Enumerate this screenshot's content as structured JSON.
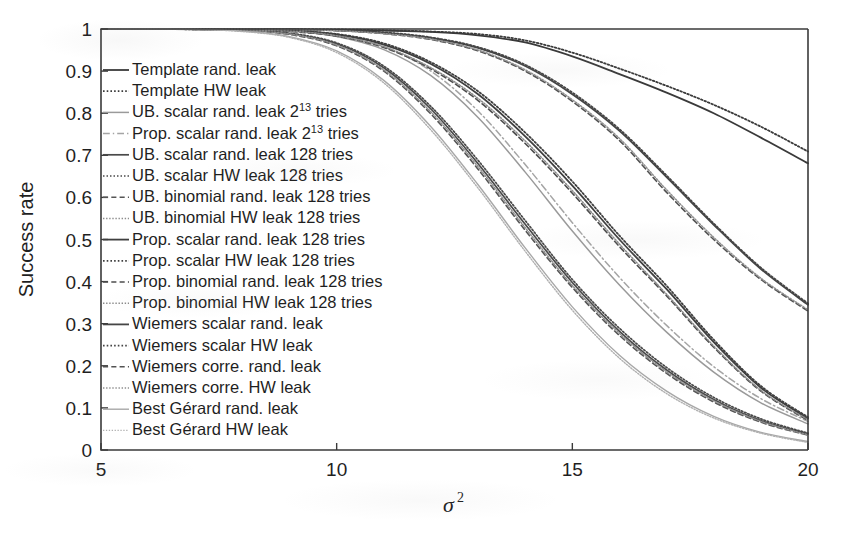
{
  "chart_data": {
    "type": "line",
    "title": "",
    "xlabel": "σ²",
    "ylabel": "Success rate",
    "xlim": [
      5,
      20
    ],
    "ylim": [
      0,
      1
    ],
    "xticks": [
      "5",
      "10",
      "15",
      "20"
    ],
    "yticks": [
      "0",
      "0.1",
      "0.2",
      "0.3",
      "0.4",
      "0.5",
      "0.6",
      "0.7",
      "0.8",
      "0.9",
      "1"
    ],
    "grid": false,
    "legend_position": "inside-left",
    "x": [
      5,
      6,
      7,
      8,
      9,
      10,
      11,
      12,
      13,
      14,
      15,
      16,
      17,
      18,
      19,
      20
    ],
    "series": [
      {
        "name": "Template rand. leak",
        "label": "Template rand. leak",
        "style": "solid",
        "color": "#3a3a3a",
        "width": 1.8,
        "values": [
          1.0,
          1.0,
          1.0,
          1.0,
          0.999,
          0.998,
          0.996,
          0.993,
          0.985,
          0.968,
          0.935,
          0.893,
          0.849,
          0.8,
          0.742,
          0.681
        ]
      },
      {
        "name": "Template HW leak",
        "label": "Template HW leak",
        "style": "dotted",
        "color": "#3a3a3a",
        "width": 1.8,
        "values": [
          1.0,
          1.0,
          1.0,
          1.0,
          0.999,
          0.999,
          0.997,
          0.994,
          0.988,
          0.973,
          0.944,
          0.906,
          0.865,
          0.82,
          0.768,
          0.709
        ]
      },
      {
        "name": "UB. scalar rand. leak 2^13 tries",
        "label": "UB. scalar rand. leak 2",
        "label_sup": "13",
        "label_tail": " tries",
        "style": "solid",
        "color": "#9a9a9a",
        "width": 1.5,
        "values": [
          1.0,
          1.0,
          1.0,
          0.999,
          0.995,
          0.982,
          0.951,
          0.889,
          0.79,
          0.66,
          0.52,
          0.392,
          0.28,
          0.185,
          0.112,
          0.062
        ]
      },
      {
        "name": "Prop. scalar rand. leak 2^13 tries",
        "label": "Prop. scalar rand. leak 2",
        "label_sup": "13",
        "label_tail": " tries",
        "style": "dashdot",
        "color": "#a5a5a5",
        "width": 1.5,
        "values": [
          1.0,
          1.0,
          1.0,
          0.999,
          0.996,
          0.985,
          0.958,
          0.9,
          0.805,
          0.678,
          0.54,
          0.41,
          0.296,
          0.198,
          0.122,
          0.068
        ]
      },
      {
        "name": "UB. scalar rand. leak 128 tries",
        "label": "UB. scalar rand. leak 128 tries",
        "style": "solid",
        "color": "#4a4a4a",
        "width": 1.7,
        "values": [
          1.0,
          1.0,
          0.999,
          0.997,
          0.989,
          0.965,
          0.908,
          0.81,
          0.68,
          0.536,
          0.398,
          0.282,
          0.19,
          0.12,
          0.07,
          0.038
        ]
      },
      {
        "name": "UB. scalar HW leak 128 tries",
        "label": "UB. scalar HW leak 128 tries",
        "style": "dotted",
        "color": "#4a4a4a",
        "width": 1.7,
        "values": [
          1.0,
          1.0,
          0.999,
          0.997,
          0.99,
          0.967,
          0.912,
          0.816,
          0.688,
          0.545,
          0.405,
          0.289,
          0.196,
          0.125,
          0.074,
          0.04
        ]
      },
      {
        "name": "UB. binomial rand. leak 128 tries",
        "label": "UB. binomial rand. leak 128 tries",
        "style": "dashed",
        "color": "#555555",
        "width": 1.6,
        "values": [
          1.0,
          1.0,
          0.999,
          0.996,
          0.987,
          0.96,
          0.9,
          0.798,
          0.667,
          0.522,
          0.386,
          0.272,
          0.182,
          0.114,
          0.066,
          0.035
        ]
      },
      {
        "name": "UB. binomial HW leak 128 tries",
        "label": "UB. binomial HW leak 128 tries",
        "style": "dotted",
        "color": "#8d8d8d",
        "width": 1.5,
        "values": [
          1.0,
          1.0,
          0.999,
          0.996,
          0.988,
          0.962,
          0.903,
          0.803,
          0.673,
          0.528,
          0.391,
          0.277,
          0.186,
          0.117,
          0.068,
          0.036
        ]
      },
      {
        "name": "Prop. scalar rand. leak 128 tries",
        "label": "Prop. scalar rand. leak 128 tries",
        "style": "solid",
        "color": "#3f3f3f",
        "width": 1.8,
        "values": [
          1.0,
          1.0,
          1.0,
          0.999,
          0.996,
          0.987,
          0.963,
          0.917,
          0.845,
          0.745,
          0.628,
          0.5,
          0.382,
          0.256,
          0.148,
          0.075
        ]
      },
      {
        "name": "Prop. scalar HW leak 128 tries",
        "label": "Prop. scalar HW leak 128 tries",
        "style": "dotted",
        "color": "#3f3f3f",
        "width": 1.8,
        "values": [
          1.0,
          1.0,
          1.0,
          0.999,
          0.996,
          0.988,
          0.966,
          0.921,
          0.852,
          0.754,
          0.638,
          0.509,
          0.39,
          0.262,
          0.152,
          0.078
        ]
      },
      {
        "name": "Prop. binomial rand. leak 128 tries",
        "label": "Prop. binomial rand. leak 128 tries",
        "style": "dashed",
        "color": "#4d4d4d",
        "width": 1.6,
        "values": [
          1.0,
          1.0,
          1.0,
          0.998,
          0.994,
          0.983,
          0.956,
          0.905,
          0.83,
          0.728,
          0.61,
          0.483,
          0.366,
          0.244,
          0.14,
          0.07
        ]
      },
      {
        "name": "Prop. binomial HW leak 128 tries",
        "label": "Prop. binomial HW leak 128 tries",
        "style": "dotted",
        "color": "#8a8a8a",
        "width": 1.5,
        "values": [
          1.0,
          1.0,
          1.0,
          0.998,
          0.995,
          0.984,
          0.958,
          0.908,
          0.835,
          0.734,
          0.616,
          0.489,
          0.37,
          0.247,
          0.142,
          0.072
        ]
      },
      {
        "name": "Wiemers scalar rand. leak",
        "label": "Wiemers scalar rand. leak",
        "style": "solid",
        "color": "#454545",
        "width": 1.8,
        "values": [
          1.0,
          1.0,
          1.0,
          1.0,
          0.999,
          0.997,
          0.991,
          0.979,
          0.955,
          0.912,
          0.845,
          0.758,
          0.648,
          0.535,
          0.43,
          0.345
        ]
      },
      {
        "name": "Wiemers scalar HW leak",
        "label": "Wiemers scalar HW leak",
        "style": "dotted",
        "color": "#454545",
        "width": 1.8,
        "values": [
          1.0,
          1.0,
          1.0,
          1.0,
          0.999,
          0.997,
          0.992,
          0.98,
          0.957,
          0.915,
          0.849,
          0.762,
          0.652,
          0.538,
          0.433,
          0.348
        ]
      },
      {
        "name": "Wiemers corre. rand. leak",
        "label": "Wiemers corre. rand. leak",
        "style": "dashed",
        "color": "#525252",
        "width": 1.6,
        "values": [
          1.0,
          1.0,
          1.0,
          1.0,
          0.999,
          0.996,
          0.989,
          0.975,
          0.948,
          0.9,
          0.828,
          0.735,
          0.612,
          0.5,
          0.405,
          0.33
        ]
      },
      {
        "name": "Wiemers corre. HW leak",
        "label": "Wiemers corre. HW leak",
        "style": "dotted",
        "color": "#8f8f8f",
        "width": 1.5,
        "values": [
          1.0,
          1.0,
          1.0,
          1.0,
          0.999,
          0.996,
          0.989,
          0.976,
          0.95,
          0.903,
          0.832,
          0.74,
          0.618,
          0.505,
          0.408,
          0.333
        ]
      },
      {
        "name": "Best Gérard rand. leak",
        "label": "Best Gérard rand. leak",
        "style": "solid",
        "color": "#a8a8a8",
        "width": 1.4,
        "values": [
          1.0,
          1.0,
          0.999,
          0.995,
          0.982,
          0.948,
          0.878,
          0.768,
          0.63,
          0.48,
          0.34,
          0.225,
          0.14,
          0.08,
          0.042,
          0.02
        ]
      },
      {
        "name": "Best Gérard HW leak",
        "label": "Best Gérard HW leak",
        "style": "dotted",
        "color": "#b0b0b0",
        "width": 1.4,
        "values": [
          1.0,
          1.0,
          0.999,
          0.994,
          0.98,
          0.944,
          0.872,
          0.76,
          0.622,
          0.472,
          0.332,
          0.218,
          0.134,
          0.076,
          0.04,
          0.018
        ]
      }
    ]
  }
}
